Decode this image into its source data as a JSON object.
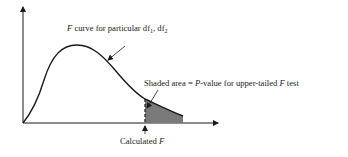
{
  "diagram": {
    "type": "F distribution curve with shaded upper tail",
    "curve_label": {
      "italic_prefix": "F",
      "text": " curve for particular df",
      "sub1": "1",
      "sep": ", df",
      "sub2": "2"
    },
    "shaded_label": {
      "part1": "Shaded area = ",
      "italic1": "P",
      "part2": "-value for upper-tailed ",
      "italic2": "F",
      "part3": " test"
    },
    "x_marker_label": {
      "text": "Calculated ",
      "italic": "F"
    },
    "colors": {
      "line": "#1a1a1a",
      "shade": "#7a7a7a",
      "background": "#ffffff"
    }
  }
}
